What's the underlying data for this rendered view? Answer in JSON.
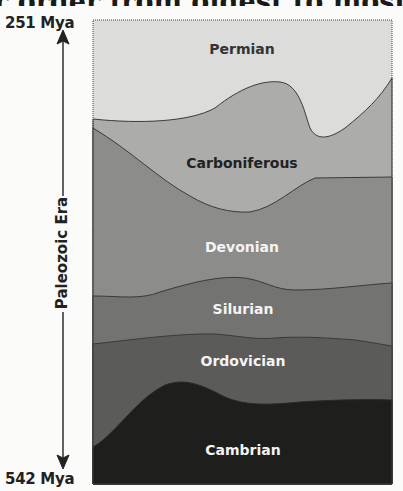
{
  "title_fragment": "r order from oldest to most recent",
  "axis": {
    "top_label": "251 Mya",
    "bottom_label": "542 Mya",
    "era_label": "Paleozoic Era",
    "direction": "time increases downward (older at bottom)"
  },
  "layers": [
    {
      "name": "Permian",
      "color": "#dcdcda",
      "text_color": "#333333",
      "order": 6
    },
    {
      "name": "Carboniferous",
      "color": "#acacaa",
      "text_color": "#222222",
      "order": 5
    },
    {
      "name": "Devonian",
      "color": "#8c8c8a",
      "text_color": "#f4f4f4",
      "order": 4
    },
    {
      "name": "Silurian",
      "color": "#737371",
      "text_color": "#f4f4f4",
      "order": 3
    },
    {
      "name": "Ordovician",
      "color": "#5b5b59",
      "text_color": "#f4f4f4",
      "order": 2
    },
    {
      "name": "Cambrian",
      "color": "#1e1e1c",
      "text_color": "#f4f4f4",
      "order": 1
    }
  ],
  "colors": {
    "frame": "#444444",
    "boundary_line": "#3a3a3a",
    "axis_ink": "#222222",
    "background": "#fbfbfa"
  }
}
